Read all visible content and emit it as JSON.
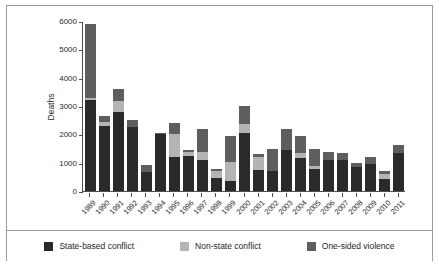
{
  "figure": {
    "y_axis_title": "Deaths"
  },
  "legend": {
    "items": [
      {
        "label": "State-based conflict",
        "color": "#2a2a2a",
        "key": "state"
      },
      {
        "label": "Non-state conflict",
        "color": "#b4b4b4",
        "key": "nonstate"
      },
      {
        "label": "One-sided violence",
        "color": "#5e5e5e",
        "key": "onesided"
      }
    ]
  },
  "chart_data": {
    "type": "bar",
    "stacked": true,
    "title": "",
    "xlabel": "",
    "ylabel": "Deaths",
    "ylim": [
      0,
      6000
    ],
    "yticks": [
      0,
      1000,
      2000,
      3000,
      4000,
      5000,
      6000
    ],
    "ytick_labels": [
      "0",
      "1000",
      "2000",
      "3000",
      "4000",
      "5000",
      "6000"
    ],
    "grid": false,
    "legend_position": "bottom",
    "categories": [
      "1989",
      "1990",
      "1991",
      "1992",
      "1993",
      "1994",
      "1995",
      "1996",
      "1997",
      "1998",
      "1999",
      "2000",
      "2001",
      "2002",
      "2003",
      "2004",
      "2005",
      "2006",
      "2007",
      "2008",
      "2009",
      "2010",
      "2011"
    ],
    "series": [
      {
        "name": "State-based conflict",
        "color": "#2a2a2a",
        "values": [
          3210,
          2310,
          2800,
          2250,
          680,
          2020,
          1190,
          1240,
          1110,
          450,
          340,
          2060,
          740,
          690,
          1430,
          1180,
          760,
          1080,
          1090,
          860,
          960,
          420,
          1340
        ]
      },
      {
        "name": "Non-state conflict",
        "color": "#b4b4b4",
        "values": [
          60,
          110,
          360,
          0,
          0,
          0,
          830,
          150,
          250,
          240,
          680,
          310,
          450,
          0,
          0,
          150,
          110,
          0,
          0,
          0,
          0,
          180,
          0
        ]
      },
      {
        "name": "One-sided violence",
        "color": "#5e5e5e",
        "values": [
          2610,
          240,
          430,
          240,
          230,
          40,
          370,
          60,
          820,
          90,
          930,
          630,
          130,
          790,
          760,
          620,
          620,
          310,
          250,
          130,
          250,
          100,
          270
        ]
      }
    ],
    "totals": [
      5880,
      2660,
      3590,
      2490,
      910,
      2060,
      2390,
      1450,
      2180,
      780,
      1950,
      3000,
      1320,
      1480,
      2190,
      1950,
      1490,
      1390,
      1340,
      990,
      1210,
      700,
      1610
    ]
  }
}
